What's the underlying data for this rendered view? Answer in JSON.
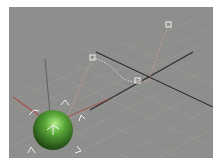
{
  "viewport": {
    "name": "Perspective",
    "background": "#8e8e8c",
    "grid_color": "#9a9a98",
    "axis_color": "#2a2a2a"
  },
  "scene": {
    "object": {
      "type": "sphere",
      "color": "#5aa83a",
      "selected": true
    },
    "motion_path": {
      "color": "#c9a0a0",
      "trajectory_color": "#e0e0e0",
      "keys": [
        {
          "x": 160,
          "y": 18
        },
        {
          "x": 84,
          "y": 51
        },
        {
          "x": 129,
          "y": 74
        }
      ]
    },
    "gizmo": {
      "x_color": "#b03a2e",
      "y_color": "#3a9a3a",
      "z_color": "#404040"
    }
  }
}
